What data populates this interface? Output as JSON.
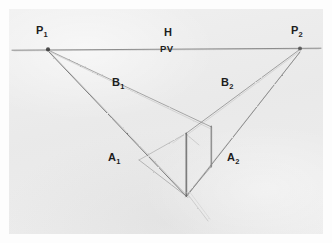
{
  "figure": {
    "kind": "hand-drawn two-point perspective construction diagram",
    "medium": "pencil on paper",
    "paper_color": "#ebebeb",
    "ink_color": "#4a4a4a",
    "label_color": "#1d1d1d",
    "canvas": {
      "width": 332,
      "height": 243
    }
  },
  "labels": {
    "left_vanishing_point": {
      "base": "P",
      "sub": "1"
    },
    "right_vanishing_point": {
      "base": "P",
      "sub": "2"
    },
    "horizon": "H",
    "picture_vertical": "PV",
    "left_upper_ray": {
      "base": "B",
      "sub": "1"
    },
    "right_upper_ray": {
      "base": "B",
      "sub": "2"
    },
    "left_lower_ray": {
      "base": "A",
      "sub": "1"
    },
    "right_lower_ray": {
      "base": "A",
      "sub": "2"
    }
  },
  "label_positions": {
    "left_vanishing_point": {
      "x": 36,
      "y": 25
    },
    "right_vanishing_point": {
      "x": 291,
      "y": 25
    },
    "horizon": {
      "x": 164,
      "y": 27
    },
    "picture_vertical": {
      "x": 160,
      "y": 44
    },
    "left_upper_ray": {
      "x": 112,
      "y": 77
    },
    "right_upper_ray": {
      "x": 221,
      "y": 77
    },
    "left_lower_ray": {
      "x": 108,
      "y": 152
    },
    "right_lower_ray": {
      "x": 227,
      "y": 152
    }
  },
  "geometry": {
    "horizon_line": {
      "x1": 12,
      "y1": 50,
      "x2": 321,
      "y2": 48
    },
    "vanishing_points": [
      {
        "name": "P1",
        "x": 48,
        "y": 49
      },
      {
        "name": "P2",
        "x": 300,
        "y": 49
      }
    ],
    "vertices": {
      "near_top": {
        "x": 186,
        "y": 133
      },
      "near_bottom": {
        "x": 186,
        "y": 196
      },
      "right_top": {
        "x": 211,
        "y": 126
      },
      "right_bottom": {
        "x": 211,
        "y": 167
      }
    },
    "rays": [
      {
        "name": "B1",
        "from": "P1",
        "x1": 48,
        "y1": 50,
        "x2": 211,
        "y2": 127
      },
      {
        "name": "A1",
        "from": "P1",
        "x1": 49,
        "y1": 52,
        "x2": 187,
        "y2": 196
      },
      {
        "name": "B2",
        "from": "P2",
        "x1": 299,
        "y1": 50,
        "x2": 186,
        "y2": 133
      },
      {
        "name": "A2",
        "from": "P2",
        "x1": 300,
        "y1": 52,
        "x2": 186,
        "y2": 196
      }
    ],
    "vertical_edges": [
      {
        "name": "near-edge",
        "x": 186,
        "y1": 133,
        "y2": 196
      },
      {
        "name": "right-edge",
        "x": 211,
        "y1": 126,
        "y2": 167
      }
    ],
    "connecting_edges": [
      {
        "name": "left-base-to-near-bottom",
        "x1": 140,
        "y1": 160,
        "x2": 186,
        "y2": 196
      },
      {
        "name": "near-top-to-left-base",
        "x1": 186,
        "y1": 133,
        "x2": 140,
        "y2": 160
      },
      {
        "name": "near-bottom-to-right-bottom",
        "x1": 186,
        "y1": 196,
        "x2": 211,
        "y2": 167
      }
    ],
    "overshoot_stroke": {
      "x1": 186,
      "y1": 193,
      "x2": 208,
      "y2": 221
    }
  }
}
